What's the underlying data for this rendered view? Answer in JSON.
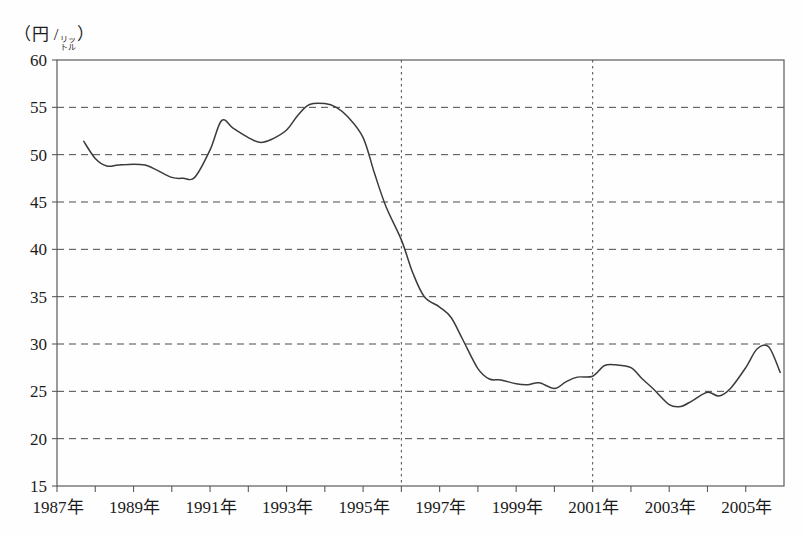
{
  "chart_data": {
    "type": "line",
    "title": "",
    "xlabel": "",
    "ylabel": "",
    "unit_label_main": "（円 /",
    "unit_label_ruby_top": "リッ",
    "unit_label_ruby_bottom": "トル",
    "unit_label_close": "）",
    "ylim": [
      15,
      60
    ],
    "y_ticks": [
      60,
      55,
      50,
      45,
      40,
      35,
      30,
      25,
      20,
      15
    ],
    "grid": true,
    "grid_axis": "y",
    "legend": "none",
    "xlim": [
      1987,
      2006
    ],
    "x_tick_labels": [
      "1987年",
      "1989年",
      "1991年",
      "1993年",
      "1995年",
      "1997年",
      "1999年",
      "2001年",
      "2003年",
      "2005年"
    ],
    "x_tick_label_years": [
      1987,
      1989,
      1991,
      1993,
      1995,
      1997,
      1999,
      2001,
      2003,
      2005
    ],
    "x_minor_tick_years": [
      1988,
      1990,
      1992,
      1994,
      1996,
      1998,
      2000,
      2002,
      2004
    ],
    "vertical_marker_years": [
      1996.0,
      2001.0
    ],
    "series": [
      {
        "name": "価格",
        "color": "#3b3b3b",
        "x": [
          1987.7,
          1988.0,
          1988.3,
          1988.6,
          1989.0,
          1989.3,
          1989.6,
          1990.0,
          1990.3,
          1990.6,
          1991.0,
          1991.3,
          1991.6,
          1992.0,
          1992.3,
          1992.6,
          1993.0,
          1993.3,
          1993.6,
          1994.0,
          1994.3,
          1994.6,
          1995.0,
          1995.3,
          1995.6,
          1996.0,
          1996.3,
          1996.6,
          1997.0,
          1997.3,
          1997.6,
          1998.0,
          1998.3,
          1998.6,
          1999.0,
          1999.3,
          1999.6,
          2000.0,
          2000.3,
          2000.6,
          2001.0,
          2001.3,
          2001.6,
          2002.0,
          2002.3,
          2002.6,
          2003.0,
          2003.3,
          2003.6,
          2004.0,
          2004.3,
          2004.6,
          2005.0,
          2005.3,
          2005.6,
          2005.9
        ],
        "values": [
          51.4,
          49.6,
          48.8,
          48.9,
          49.0,
          48.9,
          48.4,
          47.6,
          47.5,
          47.6,
          50.5,
          53.6,
          52.8,
          51.8,
          51.3,
          51.6,
          52.6,
          54.2,
          55.3,
          55.4,
          55.0,
          54.0,
          51.8,
          48.0,
          44.5,
          41.0,
          37.5,
          35.0,
          33.9,
          32.8,
          30.5,
          27.4,
          26.3,
          26.2,
          25.8,
          25.7,
          25.9,
          25.3,
          26.0,
          26.5,
          26.6,
          27.7,
          27.8,
          27.5,
          26.3,
          25.2,
          23.6,
          23.4,
          24.0,
          24.9,
          24.5,
          25.3,
          27.5,
          29.5,
          29.7,
          27.0
        ]
      }
    ]
  },
  "axes": {
    "y_axis_name": "y-axis",
    "x_axis_name": "x-axis"
  }
}
